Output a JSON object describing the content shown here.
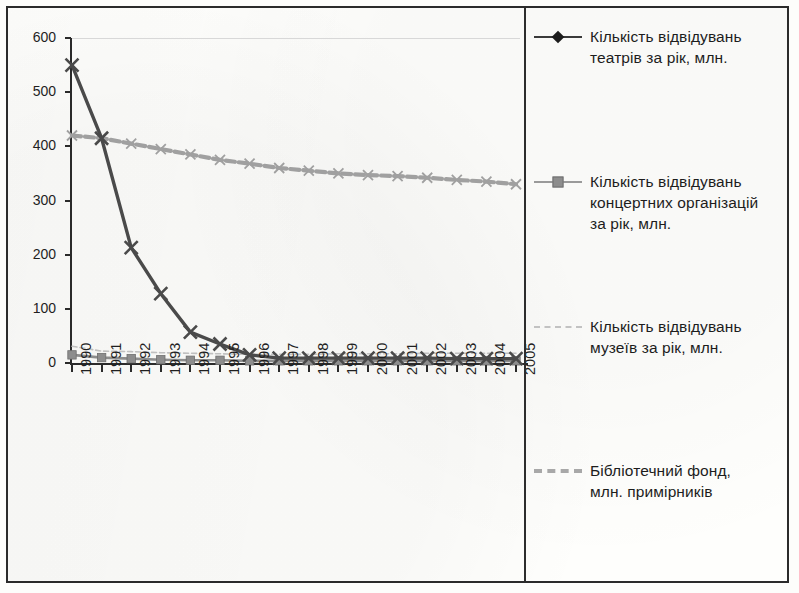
{
  "chart_data": {
    "type": "line",
    "title": "",
    "xlabel": "",
    "ylabel": "",
    "ylim": [
      0,
      600
    ],
    "yticks": [
      0,
      100,
      200,
      300,
      400,
      500,
      600
    ],
    "grid": false,
    "legend_position": "right",
    "categories": [
      "1990",
      "1991",
      "1992",
      "1993",
      "1994",
      "1995",
      "1996",
      "1997",
      "1998",
      "1999",
      "2000",
      "2001",
      "2002",
      "2003",
      "2004",
      "2005"
    ],
    "series": [
      {
        "name": "Кількість відвідувань театрів за рік, млн.",
        "marker": "x",
        "legend_marker": "diamond",
        "color": "#4a4a4a",
        "values": [
          550,
          415,
          213,
          128,
          57,
          35,
          15,
          9,
          9,
          9,
          9,
          9,
          9,
          8,
          8,
          8
        ]
      },
      {
        "name": "Кількість відвідувань концертних організацій за рік, млн.",
        "marker": "square",
        "legend_marker": "square",
        "color": "#8d8d8d",
        "values": [
          15,
          10,
          8,
          6,
          5,
          5,
          4,
          4,
          4,
          4,
          4,
          4,
          4,
          4,
          4,
          4
        ]
      },
      {
        "name": "Кількість відвідувань музеїв за рік, млн.",
        "marker": "none",
        "legend_marker": "dashed-faint",
        "color": "#c0c0c0",
        "values": [
          31,
          22,
          21,
          19,
          18,
          17,
          16,
          16,
          16,
          17,
          17,
          17,
          18,
          18,
          18,
          18
        ]
      },
      {
        "name": "Бібліотечний фонд, млн. примірників",
        "marker": "x",
        "legend_marker": "dashed-thick",
        "color": "#a0a0a0",
        "values": [
          420,
          415,
          405,
          395,
          385,
          375,
          368,
          360,
          355,
          350,
          347,
          345,
          342,
          338,
          335,
          330
        ]
      }
    ]
  },
  "legend": {
    "items": [
      {
        "label": "Кількість відвідувань\nтеатрів за рік, млн."
      },
      {
        "label": "Кількість відвідувань\nконцертних організацій\nза рік, млн."
      },
      {
        "label": "Кількість відвідувань\nмузеїв за рік, млн."
      },
      {
        "label": "Бібліотечний фонд,\nмлн. примірників"
      }
    ]
  }
}
